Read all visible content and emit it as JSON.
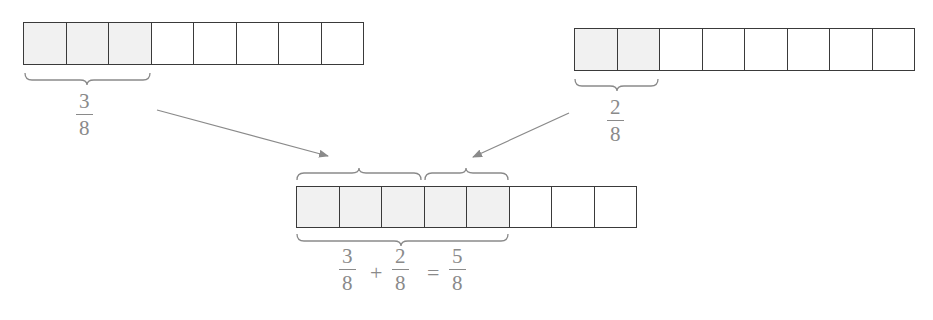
{
  "diagram": {
    "title": "",
    "colors": {
      "outline": "#3a3a3a",
      "shaded_fill": "#f1f1f1",
      "empty_fill": "#ffffff",
      "label_text": "#8a8a8a",
      "arrow": "#8a8a8a",
      "brace": "#8a8a8a"
    },
    "bar_top_left": {
      "total_parts": 8,
      "shaded_parts": 3,
      "label": {
        "numerator": "3",
        "denominator": "8"
      }
    },
    "bar_top_right": {
      "total_parts": 8,
      "shaded_parts": 2,
      "label": {
        "numerator": "2",
        "denominator": "8"
      }
    },
    "bar_result": {
      "total_parts": 8,
      "shaded_parts": 5,
      "top_braces": [
        {
          "spans_parts": 3,
          "from": "bar_top_left"
        },
        {
          "spans_parts": 2,
          "from": "bar_top_right"
        }
      ],
      "bottom_brace": {
        "spans_parts": 5
      }
    },
    "equation": {
      "term1": {
        "numerator": "3",
        "denominator": "8"
      },
      "plus": "+",
      "term2": {
        "numerator": "2",
        "denominator": "8"
      },
      "equals": "=",
      "result": {
        "numerator": "5",
        "denominator": "8"
      }
    },
    "arrows": [
      {
        "name": "left-to-result",
        "from": "bar_top_left label",
        "to": "result bar first brace"
      },
      {
        "name": "right-to-result",
        "from": "bar_top_right label",
        "to": "result bar second brace"
      }
    ]
  }
}
